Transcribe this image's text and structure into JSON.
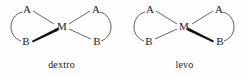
{
  "figure": {
    "background_color": "#fdfdfd",
    "line_color": "#3a3a3a",
    "text_color": "#1a1a1a"
  },
  "structures": [
    {
      "id": "dextro",
      "caption": "dextro",
      "center_label": "M",
      "atoms": {
        "top_left": "A",
        "top_right": "A",
        "bottom_left": "B",
        "bottom_right": "B"
      },
      "wedge_bond": {
        "from": "bottom_left_B",
        "to": "metal",
        "style": "bold-wedge"
      },
      "plain_bonds": [
        "top_left_A-metal",
        "top_right_A-metal",
        "bottom_right_B-metal"
      ],
      "chelate_arcs": [
        "top_left_A-bottom_left_B",
        "top_right_A-bottom_right_B"
      ]
    },
    {
      "id": "levo",
      "caption": "levo",
      "center_label": "M",
      "atoms": {
        "top_left": "A",
        "top_right": "A",
        "bottom_left": "B",
        "bottom_right": "B"
      },
      "wedge_bond": {
        "from": "metal",
        "to": "bottom_right_B",
        "style": "bold-wedge"
      },
      "plain_bonds": [
        "top_left_A-metal",
        "top_right_A-metal",
        "bottom_left_B-metal"
      ],
      "chelate_arcs": [
        "top_left_A-bottom_left_B",
        "top_right_A-bottom_right_B"
      ]
    }
  ]
}
